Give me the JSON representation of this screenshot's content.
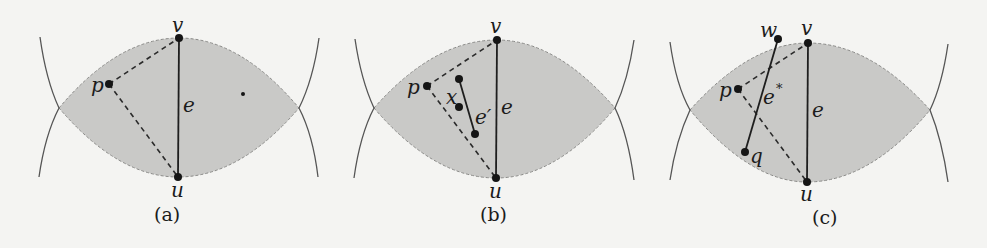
{
  "figure": {
    "panels": [
      {
        "id": "a",
        "caption": "(a)",
        "labels": {
          "v": "v",
          "u": "u",
          "p": "p",
          "e": "e"
        },
        "description": "Lens-shaped region around edge e=uv with point p connected by dashed lines to u and v"
      },
      {
        "id": "b",
        "caption": "(b)",
        "labels": {
          "v": "v",
          "u": "u",
          "p": "p",
          "e": "e",
          "x": "x",
          "e_prime": "e′"
        },
        "description": "Lens region of edge e containing point p and a shorter edge e′ with a point x"
      },
      {
        "id": "c",
        "caption": "(c)",
        "labels": {
          "v": "v",
          "u": "u",
          "p": "p",
          "e": "e",
          "w": "w",
          "q": "q",
          "e_star": "e",
          "e_star_sup": "*"
        },
        "description": "Lens region of edge e crossed by edge e* = wq, with point p inside"
      }
    ],
    "colors": {
      "background": "#f4f4f2",
      "lens_fill": "#c9c9c7",
      "lines": "#1e1e1e",
      "arcs": "#555555"
    }
  }
}
